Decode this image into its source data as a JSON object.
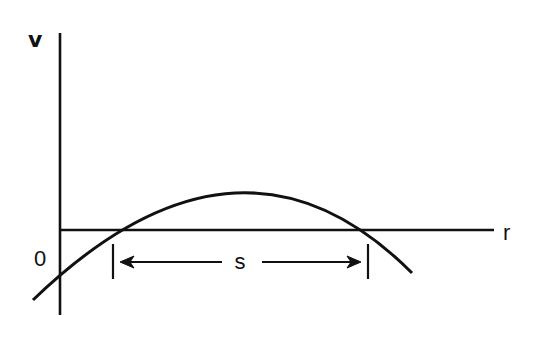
{
  "diagram": {
    "type": "potential-energy-curve",
    "labels": {
      "y_axis": "v",
      "x_axis": "r",
      "origin": "0",
      "span": "s"
    },
    "colors": {
      "background": "#ffffff",
      "ink": "#111111"
    },
    "geometry": {
      "origin": [
        60,
        230
      ],
      "y_axis": {
        "x": 60,
        "y_top": 33,
        "y_bottom": 315
      },
      "x_axis": {
        "y": 230,
        "x_start": 60,
        "x_end": 494
      },
      "curve": {
        "start": [
          33,
          300
        ],
        "crosses_y_axis_at": [
          60,
          272
        ],
        "left_root": [
          113,
          230
        ],
        "peak": [
          240,
          192
        ],
        "right_root": [
          368,
          230
        ],
        "end": [
          412,
          273
        ]
      },
      "span_marker": {
        "y": 262,
        "left_tick_x": 113,
        "right_tick_x": 368,
        "tick_y_top": 244,
        "tick_y_bottom": 279,
        "label_x": 240
      }
    }
  }
}
